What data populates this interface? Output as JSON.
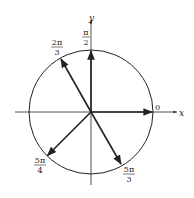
{
  "diagram": {
    "type": "unit-circle-angles",
    "center": [
      91,
      112
    ],
    "radius": 62,
    "axes": {
      "x_label": "x",
      "y_label": "y"
    },
    "angles": [
      {
        "name": "0",
        "numerator": "0",
        "denominator": "",
        "degrees": 0
      },
      {
        "name": "pi/2",
        "numerator": "π",
        "denominator": "2",
        "degrees": 90
      },
      {
        "name": "2pi/3",
        "numerator": "2π",
        "denominator": "3",
        "degrees": 120
      },
      {
        "name": "5pi/4",
        "numerator": "5π",
        "denominator": "4",
        "degrees": 225
      },
      {
        "name": "5pi/3",
        "numerator": "5π",
        "denominator": "3",
        "degrees": 300
      }
    ],
    "colors": {
      "stroke": "#222222",
      "background": "#ffffff"
    }
  }
}
